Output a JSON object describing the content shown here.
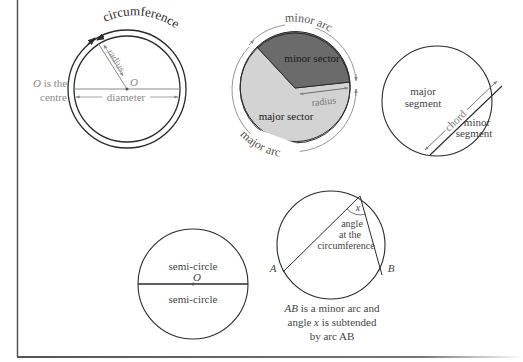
{
  "colors": {
    "stroke": "#2a2a2a",
    "annotation": "#8a8a8a",
    "minor_sector": "#6b6b6b",
    "major_sector": "#d3d3d3",
    "border": "#555555"
  },
  "circle_parts": {
    "circumference": {
      "label": "circumference",
      "centre_label_o": "O",
      "centre_note_line1": " is the",
      "centre_note_line2": "centre",
      "radius_label": "radius",
      "diameter_label": "diameter",
      "centre_symbol": "O"
    },
    "sectors": {
      "minor_arc_label": "minor arc",
      "major_arc_label": "major arc",
      "minor_sector_label": "minor sector",
      "major_sector_label": "major sector",
      "radius_label": "radius"
    },
    "segments": {
      "major_segment_line1": "major",
      "major_segment_line2": "segment",
      "minor_segment_line1": "minor",
      "minor_segment_line2": "segment",
      "chord_label": "chord"
    },
    "semicircles": {
      "upper_label": "semi-circle",
      "lower_label": "semi-circle",
      "centre_symbol": "O"
    },
    "angle_at_circumference": {
      "angle_symbol": "x",
      "angle_label_line1": "angle",
      "angle_label_line2": "at the",
      "angle_label_line3": "circumference",
      "point_a": "A",
      "point_b": "B",
      "caption_line1_ab": "AB",
      "caption_line1_rest": " is a minor arc and",
      "caption_line2_pre": "angle ",
      "caption_line2_x": "x",
      "caption_line2_rest": " is  subtended",
      "caption_line3": "by arc AB"
    }
  }
}
